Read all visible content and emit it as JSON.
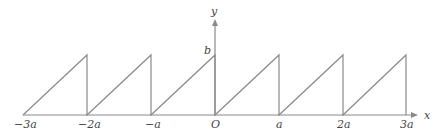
{
  "diagram": {
    "type": "sawtooth-wave",
    "axes": {
      "x_label": "y",
      "y_axis_label": "y",
      "x_axis_label": "x",
      "origin_label": "O",
      "amplitude_label": "b"
    },
    "x_tick_labels": [
      "−3a",
      "−2a",
      "−a",
      "O",
      "a",
      "2a",
      "3a"
    ],
    "colors": {
      "line": "#8a8a8a",
      "text": "#444444",
      "background": "#ffffff"
    }
  },
  "labels": {
    "neg3a_num": "−3",
    "neg2a_num": "−2",
    "neg1a_num": "−",
    "origin": "O",
    "a1_num": "",
    "a2_num": "2",
    "a3_num": "3",
    "a_symbol": "a",
    "x_axis": "x",
    "y_axis": "y",
    "b": "b"
  }
}
